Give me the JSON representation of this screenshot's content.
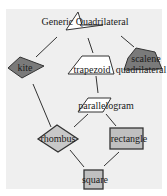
{
  "diagram": {
    "colors": {
      "background": "#efefef",
      "edge": "#333333",
      "kite_fill": "#7a7a7a",
      "scalene_fill": "#7a7a7a",
      "trapezoid_fill": "#ffffff",
      "parallelogram_fill": "#ffffff",
      "rhombus_fill": "#c8c8c8",
      "rectangle_fill": "#c0c0c0",
      "square_fill": "#c0c0c0",
      "generic_fill": "#ffffff"
    },
    "nodes": {
      "generic": {
        "label": "Generic Quadrilateral"
      },
      "kite": {
        "label": "kite"
      },
      "trapezoid": {
        "label": "trapezoid"
      },
      "scalene": {
        "label": "scalene",
        "label2": "quadrilateral"
      },
      "parallelogram": {
        "label": "parallelogram"
      },
      "rhombus": {
        "label": "rhombus"
      },
      "rectangle": {
        "label": "rectangle"
      },
      "square": {
        "label": "square"
      }
    },
    "edges": [
      [
        "generic",
        "kite"
      ],
      [
        "generic",
        "trapezoid"
      ],
      [
        "generic",
        "scalene"
      ],
      [
        "trapezoid",
        "parallelogram"
      ],
      [
        "kite",
        "rhombus"
      ],
      [
        "parallelogram",
        "rhombus"
      ],
      [
        "parallelogram",
        "rectangle"
      ],
      [
        "rhombus",
        "square"
      ],
      [
        "rectangle",
        "square"
      ]
    ]
  }
}
